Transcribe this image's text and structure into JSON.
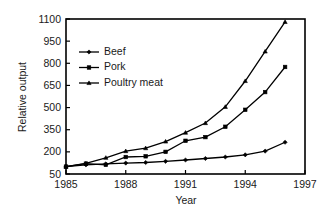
{
  "chart_data": {
    "type": "line",
    "title": "",
    "xlabel": "Year",
    "ylabel": "Relative output",
    "xlim": [
      1985,
      1997
    ],
    "ylim": [
      50,
      1100
    ],
    "grid": false,
    "legend_position": "upper-left",
    "xticks": [
      "1985",
      "1988",
      "1991",
      "1994",
      "1997"
    ],
    "xtick_values": [
      1985,
      1988,
      1991,
      1994,
      1997
    ],
    "yticks": [
      "50",
      "200",
      "350",
      "500",
      "650",
      "800",
      "950",
      "1100"
    ],
    "ytick_values": [
      50,
      200,
      350,
      500,
      650,
      800,
      950,
      1100
    ],
    "x": [
      1985,
      1986,
      1987,
      1988,
      1989,
      1990,
      1991,
      1992,
      1993,
      1994,
      1995,
      1996
    ],
    "series": [
      {
        "name": "Beef",
        "marker": "diamond",
        "values": [
          100,
          112,
          118,
          124,
          128,
          136,
          145,
          155,
          165,
          180,
          205,
          265
        ]
      },
      {
        "name": "Pork",
        "marker": "square",
        "values": [
          100,
          120,
          112,
          165,
          170,
          200,
          275,
          300,
          370,
          485,
          605,
          775
        ]
      },
      {
        "name": "Poultry meat",
        "marker": "triangle",
        "values": [
          100,
          122,
          160,
          205,
          225,
          270,
          330,
          395,
          505,
          680,
          880,
          1080
        ]
      }
    ]
  },
  "legend": {
    "entries": [
      "Beef",
      "Pork",
      "Poultry meat"
    ]
  }
}
